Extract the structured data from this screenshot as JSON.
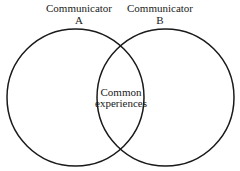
{
  "diagram": {
    "type": "venn",
    "stroke_color": "#1a1a1a",
    "background": "#ffffff",
    "circles": [
      {
        "id": "A",
        "label_line1": "Communicator",
        "label_line2": "A",
        "cx": 75.5,
        "cy": 97.5,
        "r": 68.5
      },
      {
        "id": "B",
        "label_line1": "Communicator",
        "label_line2": "B",
        "cx": 165.5,
        "cy": 97.5,
        "r": 68.5
      }
    ],
    "overlap": {
      "line1": "Common",
      "line2": "experiences"
    }
  }
}
